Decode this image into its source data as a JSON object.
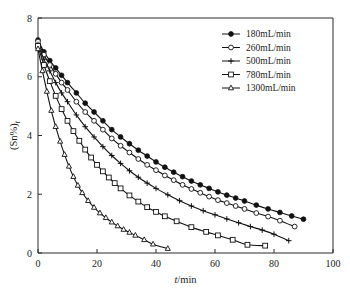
{
  "chart_data": {
    "type": "line",
    "title": "",
    "xlabel": "t/min",
    "ylabel": "(Sn%)t",
    "xlim": [
      0,
      100
    ],
    "ylim": [
      0,
      8
    ],
    "xticks": [
      0,
      20,
      40,
      60,
      80,
      100
    ],
    "yticks": [
      0,
      2,
      4,
      6,
      8
    ],
    "xtick_labels": [
      "0",
      "20",
      "40",
      "60",
      "80",
      "100"
    ],
    "ytick_labels": [
      "0",
      "2",
      "4",
      "6",
      "8"
    ],
    "grid": false,
    "legend_position": "top-right",
    "series": [
      {
        "name": "180mL/min",
        "marker": "filled-circle",
        "x": [
          0,
          2,
          4,
          6,
          8,
          10,
          13,
          16,
          19,
          22,
          25,
          28,
          31,
          34,
          37,
          40,
          43,
          46,
          49,
          52,
          55,
          58,
          61,
          64,
          67,
          70,
          74,
          78,
          82,
          86,
          90
        ],
        "y": [
          7.25,
          6.85,
          6.55,
          6.3,
          6.05,
          5.8,
          5.45,
          5.1,
          4.8,
          4.5,
          4.2,
          3.95,
          3.72,
          3.5,
          3.3,
          3.1,
          2.92,
          2.75,
          2.6,
          2.45,
          2.32,
          2.2,
          2.08,
          1.97,
          1.87,
          1.77,
          1.63,
          1.5,
          1.38,
          1.26,
          1.15
        ]
      },
      {
        "name": "260mL/min",
        "marker": "open-circle",
        "x": [
          0,
          2,
          4,
          6,
          8,
          10,
          13,
          16,
          19,
          22,
          25,
          28,
          31,
          34,
          37,
          40,
          43,
          46,
          49,
          52,
          55,
          58,
          61,
          64,
          67,
          70,
          74,
          78,
          82,
          87
        ],
        "y": [
          7.2,
          6.75,
          6.4,
          6.1,
          5.8,
          5.55,
          5.15,
          4.8,
          4.5,
          4.2,
          3.9,
          3.65,
          3.42,
          3.2,
          3.0,
          2.82,
          2.64,
          2.48,
          2.32,
          2.18,
          2.05,
          1.92,
          1.8,
          1.7,
          1.6,
          1.5,
          1.36,
          1.24,
          1.1,
          0.9
        ]
      },
      {
        "name": "500mL/min",
        "marker": "plus",
        "x": [
          0,
          2,
          4,
          6,
          8,
          10,
          13,
          16,
          19,
          22,
          25,
          28,
          31,
          34,
          37,
          40,
          44,
          48,
          52,
          56,
          60,
          64,
          68,
          72,
          76,
          80,
          85
        ],
        "y": [
          7.1,
          6.6,
          6.2,
          5.8,
          5.45,
          5.15,
          4.7,
          4.3,
          3.95,
          3.62,
          3.32,
          3.05,
          2.8,
          2.58,
          2.38,
          2.2,
          1.98,
          1.78,
          1.6,
          1.44,
          1.3,
          1.16,
          1.03,
          0.9,
          0.78,
          0.64,
          0.42
        ]
      },
      {
        "name": "780mL/min",
        "marker": "open-square",
        "x": [
          0,
          2,
          4,
          6,
          8,
          10,
          12,
          14,
          16,
          18,
          20,
          22,
          24,
          26,
          28,
          31,
          34,
          37,
          40,
          43,
          47,
          52,
          57,
          61,
          66,
          71,
          77
        ],
        "y": [
          7.05,
          6.4,
          5.85,
          5.35,
          4.9,
          4.5,
          4.15,
          3.82,
          3.52,
          3.25,
          3.0,
          2.78,
          2.57,
          2.38,
          2.2,
          1.96,
          1.75,
          1.56,
          1.4,
          1.25,
          1.08,
          0.88,
          0.72,
          0.6,
          0.45,
          0.28,
          0.25
        ]
      },
      {
        "name": "1300mL/min",
        "marker": "open-triangle",
        "x": [
          0,
          1.5,
          3,
          4.5,
          6,
          7.5,
          9,
          10.5,
          12,
          13.5,
          15,
          17,
          19,
          21,
          23,
          25,
          27,
          29,
          31,
          33,
          36,
          39,
          44
        ],
        "y": [
          6.95,
          6.2,
          5.5,
          4.85,
          4.3,
          3.8,
          3.35,
          2.95,
          2.6,
          2.3,
          2.05,
          1.78,
          1.55,
          1.36,
          1.2,
          1.05,
          0.92,
          0.8,
          0.7,
          0.6,
          0.45,
          0.3,
          0.15
        ]
      }
    ]
  },
  "legend": {
    "entries": [
      {
        "label": "180mL/min"
      },
      {
        "label": "260mL/min"
      },
      {
        "label": "500mL/min"
      },
      {
        "label": "780mL/min"
      },
      {
        "label": "1300mL/min"
      }
    ]
  },
  "axes": {
    "x_title": "t/min",
    "x_title_italic_part": "t",
    "x_title_rest": "/min",
    "y_title_main": "(Sn%)",
    "y_title_sub": "t"
  },
  "colors": {
    "line": "#111111",
    "axis": "#2b2b2b",
    "background": "#ffffff",
    "text": "#1a1a1a"
  }
}
